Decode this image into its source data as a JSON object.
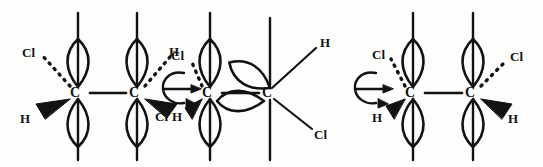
{
  "diagram": {
    "type": "orbital-sawhorse-rotation-sequence",
    "ink_color": "#121212",
    "background_color": "#fdfdfb",
    "bond_label": "C",
    "structures": [
      {
        "id": "structure-1",
        "name": "anti-conformer-left",
        "carbons": [
          {
            "id": "c1",
            "label": "C",
            "x": 78,
            "y": 93,
            "substituents": [
              {
                "label": "Cl",
                "bond": "dashed",
                "direction": "up-left",
                "x": 22,
                "y": 46
              },
              {
                "label": "H",
                "bond": "wedge",
                "direction": "down-left",
                "x": 20,
                "y": 112
              }
            ],
            "orbitals": [
              {
                "type": "lobe",
                "direction": "up",
                "shape": "teardrop"
              },
              {
                "type": "lobe",
                "direction": "down",
                "shape": "teardrop"
              }
            ]
          },
          {
            "id": "c2",
            "label": "C",
            "x": 137,
            "y": 93,
            "substituents": [
              {
                "label": "H",
                "bond": "dashed",
                "direction": "up-right",
                "x": 158,
                "y": 46
              },
              {
                "label": "Cl",
                "bond": "wedge",
                "direction": "down-right",
                "x": 155,
                "y": 110
              }
            ],
            "orbitals": [
              {
                "type": "lobe",
                "direction": "up",
                "shape": "teardrop"
              },
              {
                "type": "lobe",
                "direction": "down",
                "shape": "teardrop"
              }
            ]
          }
        ]
      },
      {
        "id": "structure-2",
        "name": "rotating-conformer-middle",
        "carbons": [
          {
            "id": "c3",
            "label": "C",
            "x": 210,
            "y": 93,
            "substituents": [
              {
                "label": "Cl",
                "bond": "dashed",
                "direction": "up-left",
                "x": 171,
                "y": 49
              },
              {
                "label": "H",
                "bond": "wedge",
                "direction": "down-left",
                "x": 172,
                "y": 110
              }
            ],
            "orbitals": [
              {
                "type": "lobe",
                "direction": "up",
                "shape": "teardrop"
              },
              {
                "type": "lobe",
                "direction": "down",
                "shape": "teardrop"
              }
            ]
          },
          {
            "id": "c4",
            "label": "C",
            "x": 270,
            "y": 93,
            "substituents": [
              {
                "label": "H",
                "bond": "plain",
                "direction": "up-right",
                "x": 320,
                "y": 40
              },
              {
                "label": "Cl",
                "bond": "plain",
                "direction": "down-right",
                "x": 321,
                "y": 115
              }
            ],
            "orbitals": [
              {
                "type": "lobe",
                "direction": "up-right-rotated",
                "shape": "teardrop"
              },
              {
                "type": "lobe",
                "direction": "left-rotated",
                "shape": "teardrop"
              },
              {
                "type": "axis",
                "direction": "vertical",
                "shape": "line"
              }
            ]
          }
        ]
      },
      {
        "id": "structure-3",
        "name": "anti-conformer-right",
        "carbons": [
          {
            "id": "c5",
            "label": "C",
            "x": 413,
            "y": 93,
            "substituents": [
              {
                "label": "Cl",
                "bond": "dashed",
                "direction": "up-left",
                "x": 372,
                "y": 48
              },
              {
                "label": "H",
                "bond": "wedge",
                "direction": "down-left",
                "x": 372,
                "y": 111
              }
            ],
            "orbitals": [
              {
                "type": "lobe",
                "direction": "up",
                "shape": "teardrop"
              },
              {
                "type": "lobe",
                "direction": "down",
                "shape": "teardrop"
              }
            ]
          },
          {
            "id": "c6",
            "label": "C",
            "x": 473,
            "y": 93,
            "substituents": [
              {
                "label": "Cl",
                "bond": "dashed",
                "direction": "up-right",
                "x": 510,
                "y": 50
              },
              {
                "label": "H",
                "bond": "wedge",
                "direction": "down-right",
                "x": 508,
                "y": 112
              }
            ],
            "orbitals": [
              {
                "type": "lobe",
                "direction": "up",
                "shape": "teardrop"
              },
              {
                "type": "lobe",
                "direction": "down",
                "shape": "teardrop"
              }
            ]
          }
        ]
      }
    ],
    "rotation_arrows": [
      {
        "id": "rotation-arrow-1",
        "x": 170,
        "y": 88,
        "name": "bond-rotation-symbol",
        "parts": [
          "curved-loop-arrow",
          "straight-arrow"
        ]
      },
      {
        "id": "rotation-arrow-2",
        "x": 362,
        "y": 88,
        "name": "bond-rotation-symbol",
        "parts": [
          "curved-loop-arrow",
          "straight-arrow"
        ]
      }
    ]
  }
}
